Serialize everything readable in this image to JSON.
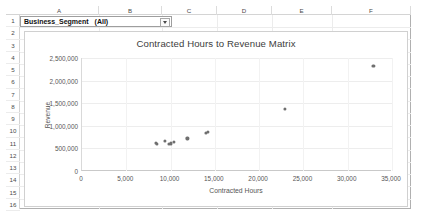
{
  "app": "excel-worksheet",
  "worksheet": {
    "column_headers": [
      "A",
      "B",
      "C",
      "D",
      "E",
      "F"
    ],
    "row_headers": [
      "1",
      "2",
      "3",
      "4",
      "5",
      "6",
      "7",
      "8",
      "9",
      "10",
      "11",
      "12",
      "13",
      "14",
      "15",
      "16"
    ]
  },
  "pivot_filter": {
    "field_label": "Business_Segment",
    "selected_value": "(All)",
    "dropdown_icon": "chevron-down-icon"
  },
  "chart_data": {
    "type": "scatter",
    "title": "Contracted Hours to Revenue Matrix",
    "xlabel": "Contracted Hours",
    "ylabel": "Revenue",
    "xlim": [
      0,
      35000
    ],
    "ylim": [
      0,
      2500000
    ],
    "xticks": [
      0,
      5000,
      10000,
      15000,
      20000,
      25000,
      30000,
      35000
    ],
    "xtick_labels": [
      "0",
      "5,000",
      "10,000",
      "15,000",
      "20,000",
      "25,000",
      "30,000",
      "35,000"
    ],
    "yticks": [
      0,
      500000,
      1000000,
      1500000,
      2000000,
      2500000
    ],
    "ytick_labels": [
      "0",
      "500,000",
      "1,000,000",
      "1,500,000",
      "2,000,000",
      "2,500,000"
    ],
    "grid": true,
    "legend": false,
    "marker_color": "#6f6f6f",
    "series": [
      {
        "name": "Contracted Hours vs Revenue",
        "points": [
          [
            8350,
            620000
          ],
          [
            8500,
            600000
          ],
          [
            9350,
            660000
          ],
          [
            9800,
            600000
          ],
          [
            10050,
            610000
          ],
          [
            10400,
            650000
          ],
          [
            11900,
            720000
          ],
          [
            14000,
            840000
          ],
          [
            14250,
            860000
          ],
          [
            22900,
            1380000
          ],
          [
            32900,
            2320000
          ]
        ]
      }
    ]
  }
}
